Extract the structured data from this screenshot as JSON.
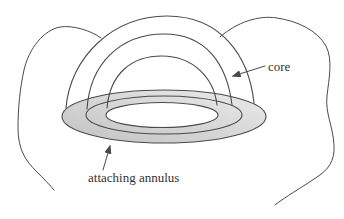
{
  "figure": {
    "labels": {
      "core": "core",
      "attaching_annulus": "attaching annulus"
    },
    "colors": {
      "background": "#ffffff",
      "line": "#4a4a4a",
      "text": "#333333",
      "annulus_shade_light": "#ebebeb",
      "annulus_shade_dark": "#c2c2c2"
    }
  }
}
